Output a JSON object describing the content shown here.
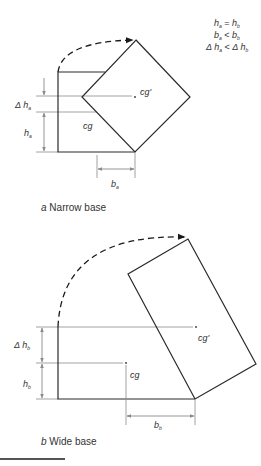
{
  "conditions": {
    "line1": {
      "left": "h",
      "left_sub": "a",
      "op": "=",
      "right": "h",
      "right_sub": "b"
    },
    "line2": {
      "left": "b",
      "left_sub": "a",
      "op": "<",
      "right": "b",
      "right_sub": "b"
    },
    "line3": {
      "left": "Δ h",
      "left_sub": "a",
      "op": "<",
      "right": "Δ h",
      "right_sub": "b"
    }
  },
  "panel_a": {
    "caption_letter": "a",
    "caption_text": "Narrow base",
    "cg_label": "cg",
    "cg_prime_label": "cg'",
    "delta_h_label": "Δ h",
    "delta_h_sub": "a",
    "h_label": "h",
    "h_sub": "a",
    "b_label": "b",
    "b_sub": "a"
  },
  "panel_b": {
    "caption_letter": "b",
    "caption_text": "Wide base",
    "cg_label": "cg",
    "cg_prime_label": "cg'",
    "delta_h_label": "Δ h",
    "delta_h_sub": "b",
    "h_label": "h",
    "h_sub": "b",
    "b_label": "b",
    "b_sub": "b"
  },
  "colors": {
    "shape_stroke": "#2a2a2a",
    "guide_stroke": "#8a8a8a",
    "text": "#333333"
  }
}
